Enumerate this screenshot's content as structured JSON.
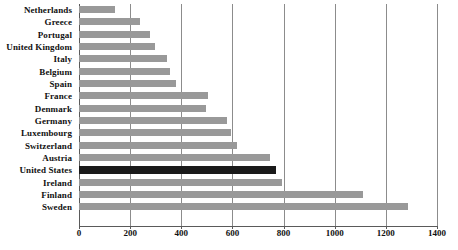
{
  "chart_data": {
    "type": "bar",
    "orientation": "horizontal",
    "title": "",
    "subtitle": "",
    "xlabel": "",
    "ylabel": "",
    "xlim": [
      0,
      1400
    ],
    "ylim": null,
    "grid": "vertical",
    "legend": "none",
    "xticks": [
      0,
      200,
      400,
      600,
      800,
      1000,
      1200,
      1400
    ],
    "xtick_labels": [
      "0",
      "200",
      "400",
      "600",
      "800",
      "1000",
      "1200",
      "1400"
    ],
    "categories": [
      "Netherlands",
      "Greece",
      "Portugal",
      "United Kingdom",
      "Italy",
      "Belgium",
      "Spain",
      "France",
      "Denmark",
      "Germany",
      "Luxembourg",
      "Switzerland",
      "Austria",
      "United States",
      "Ireland",
      "Finland",
      "Sweden"
    ],
    "values": [
      141,
      239,
      278,
      297,
      344,
      356,
      379,
      504,
      497,
      579,
      594,
      618,
      747,
      770,
      794,
      1110,
      1286
    ],
    "highlight_category": "United States",
    "annotations": []
  },
  "colors": {
    "bar": "#999999",
    "bar_highlight": "#1a1a1a",
    "gridline": "#8c8c8c",
    "axis": "#5a5a5a",
    "text": "#111111",
    "background": "#ffffff"
  }
}
